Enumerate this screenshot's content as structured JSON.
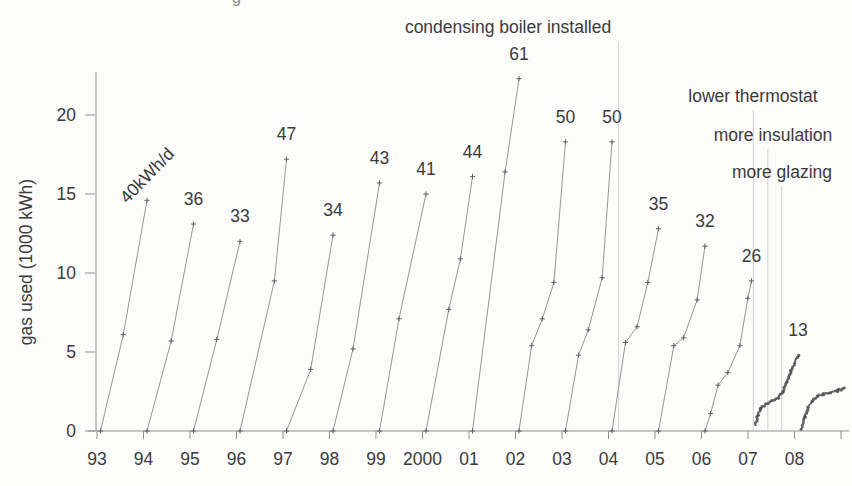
{
  "figure": {
    "background": "#fcfcfb",
    "ink_color": "#3b3b3b",
    "curve_color": "#969696",
    "marker_color": "#616161",
    "dot_color": "#4e4e4e",
    "axis_color": "#8f8f8f",
    "event_line_color": "#d7d7d7"
  },
  "chart_data": {
    "type": "line",
    "ylabel": "gas used (1000 kWh)",
    "x_tick_labels": [
      "93",
      "94",
      "95",
      "96",
      "97",
      "98",
      "99",
      "2000",
      "01",
      "02",
      "03",
      "04",
      "05",
      "06",
      "07",
      "08"
    ],
    "y_ticks": [
      0,
      5,
      10,
      15,
      20
    ],
    "ylim": [
      0,
      23
    ],
    "x_years": [
      1993,
      2008
    ],
    "grid": "off",
    "series": [
      {
        "year": "1993",
        "label": "40kWh/d",
        "kwh_per_day": 40,
        "style": "plus",
        "rotate_label": -46,
        "points": [
          [
            0,
            0
          ],
          [
            0.49,
            6.1
          ],
          [
            1,
            14.6
          ]
        ]
      },
      {
        "year": "1994",
        "label": "36",
        "kwh_per_day": 36,
        "style": "plus",
        "points": [
          [
            0,
            0
          ],
          [
            0.52,
            5.7
          ],
          [
            1,
            13.1
          ]
        ]
      },
      {
        "year": "1995",
        "label": "33",
        "kwh_per_day": 33,
        "style": "plus",
        "points": [
          [
            0,
            0
          ],
          [
            0.5,
            5.8
          ],
          [
            1,
            12.0
          ]
        ]
      },
      {
        "year": "1996",
        "label": "47",
        "kwh_per_day": 47,
        "style": "plus",
        "points": [
          [
            0,
            0
          ],
          [
            0.74,
            9.5
          ],
          [
            1,
            17.2
          ]
        ]
      },
      {
        "year": "1997",
        "label": "34",
        "kwh_per_day": 34,
        "style": "plus",
        "points": [
          [
            0,
            0
          ],
          [
            0.52,
            3.9
          ],
          [
            1,
            12.4
          ]
        ]
      },
      {
        "year": "1998",
        "label": "43",
        "kwh_per_day": 43,
        "style": "plus",
        "points": [
          [
            0,
            0
          ],
          [
            0.43,
            5.2
          ],
          [
            1,
            15.7
          ]
        ]
      },
      {
        "year": "1999",
        "label": "41",
        "kwh_per_day": 41,
        "style": "plus",
        "points": [
          [
            0,
            0
          ],
          [
            0.42,
            7.1
          ],
          [
            1,
            15.0
          ]
        ]
      },
      {
        "year": "2000",
        "label": "44",
        "kwh_per_day": 44,
        "style": "plus",
        "points": [
          [
            0,
            0
          ],
          [
            0.49,
            7.7
          ],
          [
            0.74,
            10.9
          ],
          [
            1,
            16.1
          ]
        ]
      },
      {
        "year": "2001",
        "label": "61",
        "kwh_per_day": 61,
        "style": "plus",
        "points": [
          [
            0,
            0
          ],
          [
            0.7,
            16.4
          ],
          [
            1,
            22.3
          ]
        ]
      },
      {
        "year": "2002",
        "label": "50",
        "kwh_per_day": 50,
        "style": "plus",
        "points": [
          [
            0,
            0
          ],
          [
            0.27,
            5.4
          ],
          [
            0.5,
            7.1
          ],
          [
            0.75,
            9.4
          ],
          [
            1,
            18.3
          ]
        ]
      },
      {
        "year": "2003",
        "label": "50",
        "kwh_per_day": 50,
        "style": "plus",
        "points": [
          [
            0,
            0
          ],
          [
            0.28,
            4.8
          ],
          [
            0.49,
            6.4
          ],
          [
            0.79,
            9.7
          ],
          [
            1,
            18.3
          ]
        ]
      },
      {
        "year": "2004",
        "label": "35",
        "kwh_per_day": 35,
        "style": "plus",
        "points": [
          [
            0,
            0
          ],
          [
            0.29,
            5.6
          ],
          [
            0.54,
            6.6
          ],
          [
            0.77,
            9.4
          ],
          [
            1,
            12.8
          ]
        ]
      },
      {
        "year": "2005",
        "label": "32",
        "kwh_per_day": 32,
        "style": "plus",
        "points": [
          [
            0,
            0
          ],
          [
            0.33,
            5.4
          ],
          [
            0.54,
            5.9
          ],
          [
            0.83,
            8.3
          ],
          [
            1,
            11.7
          ]
        ]
      },
      {
        "year": "2006",
        "label": "26",
        "kwh_per_day": 26,
        "style": "plus",
        "points": [
          [
            0,
            0
          ],
          [
            0.12,
            1.1
          ],
          [
            0.28,
            2.9
          ],
          [
            0.49,
            3.7
          ],
          [
            0.75,
            5.4
          ],
          [
            0.92,
            8.4
          ],
          [
            1,
            9.5
          ]
        ]
      },
      {
        "year": "2007",
        "label": "13",
        "kwh_per_day": 13,
        "style": "dots",
        "points": [
          [
            0.07,
            0.4
          ],
          [
            0.14,
            1.0
          ],
          [
            0.2,
            1.4
          ],
          [
            0.31,
            1.7
          ],
          [
            0.44,
            1.9
          ],
          [
            0.57,
            2.1
          ],
          [
            0.68,
            2.5
          ],
          [
            0.76,
            3.1
          ],
          [
            0.85,
            3.8
          ],
          [
            0.92,
            4.3
          ],
          [
            1,
            4.8
          ]
        ]
      },
      {
        "year": "2008",
        "label": "",
        "kwh_per_day": null,
        "style": "dots",
        "points": [
          [
            0.08,
            0.1
          ],
          [
            0.15,
            0.9
          ],
          [
            0.22,
            1.5
          ],
          [
            0.3,
            1.9
          ],
          [
            0.42,
            2.2
          ],
          [
            0.55,
            2.35
          ],
          [
            0.7,
            2.45
          ],
          [
            0.85,
            2.55
          ],
          [
            1,
            2.7
          ]
        ]
      }
    ],
    "events": [
      {
        "text": "condensing boiler installed",
        "at_year": 2004.14,
        "label_x": 508,
        "label_y": 33,
        "line_top": 42
      },
      {
        "text": "lower thermostat",
        "at_year": 2007.04,
        "label_x": 753,
        "label_y": 102,
        "line_top": 110
      },
      {
        "text": "more insulation",
        "at_year": 2007.35,
        "label_x": 773,
        "label_y": 141,
        "line_top": 149
      },
      {
        "text": "more glazing",
        "at_year": 2007.65,
        "label_x": 782,
        "label_y": 178,
        "line_top": 186
      }
    ],
    "scan_artifact_glyph": "g"
  }
}
